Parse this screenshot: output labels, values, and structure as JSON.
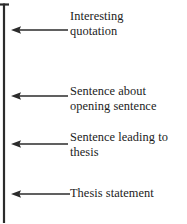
{
  "diagram": {
    "type": "bracket-with-arrows",
    "background_color": "#ffffff",
    "line_color": "#2b2b2b",
    "text_color": "#1c1c1c",
    "bracket": {
      "name": "left-bracket",
      "spine_x": 4,
      "spine_top": 4,
      "spine_bottom": 223,
      "top_stub_from_x": 0,
      "top_stub_to_x": 9,
      "top_stub_y": 4
    },
    "arrows": [
      {
        "id": "arrow-1",
        "label": "Interesting\nquotation",
        "y": 30,
        "tip_x": 12,
        "tail_x": 68
      },
      {
        "id": "arrow-2",
        "label": "Sentence about\nopening sentence",
        "y": 96,
        "tip_x": 12,
        "tail_x": 68
      },
      {
        "id": "arrow-3",
        "label": "Sentence leading to\nthesis",
        "y": 144,
        "tip_x": 12,
        "tail_x": 68
      },
      {
        "id": "arrow-4",
        "label": "Thesis statement",
        "y": 194,
        "tip_x": 12,
        "tail_x": 70
      }
    ]
  }
}
